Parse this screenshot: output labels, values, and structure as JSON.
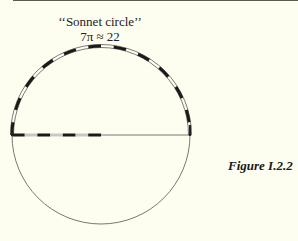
{
  "figure": {
    "title_line1": "‘‘Sonnet circle’’",
    "title_line2": "7π ≈ 22",
    "caption": "Figure I.2.2"
  },
  "geometry": {
    "center_x": 101,
    "center_y": 135,
    "radius": 89,
    "semicircle_segments": 22,
    "radius_segments": 7
  },
  "colors": {
    "background": "#fdfdf0",
    "ink": "#1a1a1a",
    "rule": "#5a5a52"
  }
}
